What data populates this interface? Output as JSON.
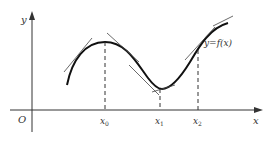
{
  "diagram": {
    "axes": {
      "x_label": "x",
      "y_label": "y",
      "origin_label": "O"
    },
    "curve_label": "y=f(x)",
    "points": [
      {
        "label": "x",
        "sub": "0",
        "x": 105,
        "note": "local maximum"
      },
      {
        "label": "x",
        "sub": "1",
        "x": 160,
        "note": "local minimum"
      },
      {
        "label": "x",
        "sub": "2",
        "x": 198,
        "note": "point on increasing part"
      }
    ],
    "colors": {
      "curve": "#111111",
      "axis": "#333333",
      "tangent": "#444444"
    }
  }
}
